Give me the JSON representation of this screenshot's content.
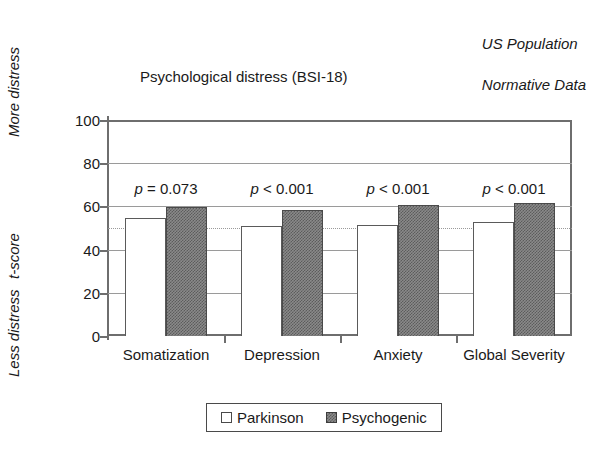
{
  "annotation": {
    "line1": "US Population",
    "line2": "Normative Data"
  },
  "axis_captions": {
    "more_distress": "More distress",
    "t_score": "t-score",
    "less_distress": "Less distress"
  },
  "legend": {
    "parkinson": "Parkinson",
    "psychogenic": "Psychogenic"
  },
  "chart_data": {
    "type": "bar",
    "title": "Psychological distress (BSI-18)",
    "xlabel": "",
    "ylabel": "t-score",
    "ylim": [
      0,
      100
    ],
    "yticks": [
      0,
      20,
      40,
      60,
      80,
      100
    ],
    "grid": true,
    "legend_position": "bottom-center",
    "categories": [
      "Somatization",
      "Depression",
      "Anxiety",
      "Global Severity"
    ],
    "series": [
      {
        "name": "Parkinson",
        "values": [
          54.5,
          51.0,
          51.5,
          53.0
        ]
      },
      {
        "name": "Psychogenic",
        "values": [
          59.5,
          58.5,
          60.5,
          61.5
        ]
      }
    ],
    "annotations": [
      "p = 0.073",
      "p < 0.001",
      "p < 0.001",
      "p < 0.001"
    ],
    "p_values": [
      {
        "category": "Somatization",
        "operator": "=",
        "value": "0.073"
      },
      {
        "category": "Depression",
        "operator": "<",
        "value": "0.001"
      },
      {
        "category": "Anxiety",
        "operator": "<",
        "value": "0.001"
      },
      {
        "category": "Global Severity",
        "operator": "<",
        "value": "0.001"
      }
    ],
    "reference_line": {
      "value": 50,
      "label": "US Population Normative Data",
      "style": "dotted"
    },
    "colors": {
      "parkinson": "#ffffff",
      "psychogenic": "#808080",
      "axis": "#6e6e6e",
      "grid": "#9a9a9a",
      "text": "#1a1a1a"
    }
  }
}
